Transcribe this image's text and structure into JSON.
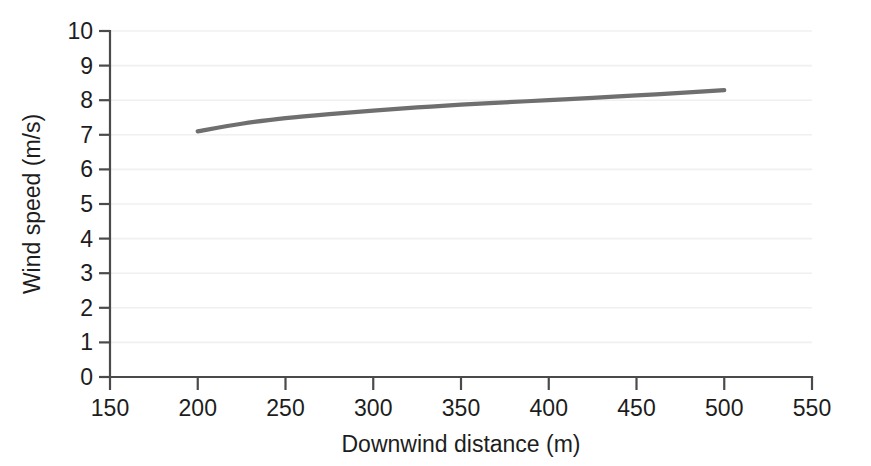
{
  "chart_data": {
    "type": "line",
    "title": "",
    "subtitle": "",
    "xlabel": "Downwind distance (m)",
    "ylabel": "Wind speed (m/s)",
    "xlim": [
      150,
      550
    ],
    "ylim": [
      0,
      10
    ],
    "xticks": [
      150,
      200,
      250,
      300,
      350,
      400,
      450,
      500,
      550
    ],
    "yticks": [
      0,
      1,
      2,
      3,
      4,
      5,
      6,
      7,
      8,
      9,
      10
    ],
    "xtick_labels": [
      "150",
      "200",
      "250",
      "300",
      "350",
      "400",
      "450",
      "500",
      "550"
    ],
    "ytick_labels": [
      "0",
      "1",
      "2",
      "3",
      "4",
      "5",
      "6",
      "7",
      "8",
      "9",
      "10"
    ],
    "grid": true,
    "grid_color": "#f0f0f0",
    "legend": null,
    "legend_position": "none",
    "annotations": [],
    "line_color": "#6f6f6f",
    "series": [
      {
        "name": "Wind speed",
        "color": "#6f6f6f",
        "x": [
          200,
          225,
          250,
          275,
          300,
          325,
          350,
          375,
          400,
          425,
          450,
          475,
          500
        ],
        "values": [
          7.1,
          7.32,
          7.48,
          7.6,
          7.7,
          7.79,
          7.87,
          7.94,
          8.0,
          8.07,
          8.14,
          8.21,
          8.29
        ]
      }
    ]
  },
  "figure": {
    "background_color": "#ffffff",
    "axis_color": "#4a4a4a",
    "text_color": "#1d1d1d"
  }
}
